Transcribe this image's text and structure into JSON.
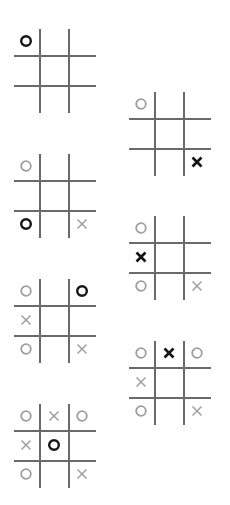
{
  "diagram": {
    "title": "",
    "colors": {
      "grid_line": "#6a6a6a",
      "mark_recent": "#151515",
      "mark_previous": "#9e9e9e",
      "background": "#ffffff"
    },
    "boards": [
      {
        "id": 1,
        "position": {
          "x": 14,
          "y": 29
        },
        "cells": [
          [
            {
              "mark": "O",
              "recent": true
            },
            {
              "mark": "",
              "recent": false
            },
            {
              "mark": "",
              "recent": false
            }
          ],
          [
            {
              "mark": "",
              "recent": false
            },
            {
              "mark": "",
              "recent": false
            },
            {
              "mark": "",
              "recent": false
            }
          ],
          [
            {
              "mark": "",
              "recent": false
            },
            {
              "mark": "",
              "recent": false
            },
            {
              "mark": "",
              "recent": false
            }
          ]
        ]
      },
      {
        "id": 2,
        "position": {
          "x": 129,
          "y": 92
        },
        "cells": [
          [
            {
              "mark": "O",
              "recent": false
            },
            {
              "mark": "",
              "recent": false
            },
            {
              "mark": "",
              "recent": false
            }
          ],
          [
            {
              "mark": "",
              "recent": false
            },
            {
              "mark": "",
              "recent": false
            },
            {
              "mark": "",
              "recent": false
            }
          ],
          [
            {
              "mark": "",
              "recent": false
            },
            {
              "mark": "",
              "recent": false
            },
            {
              "mark": "X",
              "recent": true
            }
          ]
        ]
      },
      {
        "id": 3,
        "position": {
          "x": 14,
          "y": 154
        },
        "cells": [
          [
            {
              "mark": "O",
              "recent": false
            },
            {
              "mark": "",
              "recent": false
            },
            {
              "mark": "",
              "recent": false
            }
          ],
          [
            {
              "mark": "",
              "recent": false
            },
            {
              "mark": "",
              "recent": false
            },
            {
              "mark": "",
              "recent": false
            }
          ],
          [
            {
              "mark": "O",
              "recent": true
            },
            {
              "mark": "",
              "recent": false
            },
            {
              "mark": "X",
              "recent": false
            }
          ]
        ]
      },
      {
        "id": 4,
        "position": {
          "x": 129,
          "y": 216
        },
        "cells": [
          [
            {
              "mark": "O",
              "recent": false
            },
            {
              "mark": "",
              "recent": false
            },
            {
              "mark": "",
              "recent": false
            }
          ],
          [
            {
              "mark": "X",
              "recent": true
            },
            {
              "mark": "",
              "recent": false
            },
            {
              "mark": "",
              "recent": false
            }
          ],
          [
            {
              "mark": "O",
              "recent": false
            },
            {
              "mark": "",
              "recent": false
            },
            {
              "mark": "X",
              "recent": false
            }
          ]
        ]
      },
      {
        "id": 5,
        "position": {
          "x": 14,
          "y": 279
        },
        "cells": [
          [
            {
              "mark": "O",
              "recent": false
            },
            {
              "mark": "",
              "recent": false
            },
            {
              "mark": "O",
              "recent": true
            }
          ],
          [
            {
              "mark": "X",
              "recent": false
            },
            {
              "mark": "",
              "recent": false
            },
            {
              "mark": "",
              "recent": false
            }
          ],
          [
            {
              "mark": "O",
              "recent": false
            },
            {
              "mark": "",
              "recent": false
            },
            {
              "mark": "X",
              "recent": false
            }
          ]
        ]
      },
      {
        "id": 6,
        "position": {
          "x": 129,
          "y": 341
        },
        "cells": [
          [
            {
              "mark": "O",
              "recent": false
            },
            {
              "mark": "X",
              "recent": true
            },
            {
              "mark": "O",
              "recent": false
            }
          ],
          [
            {
              "mark": "X",
              "recent": false
            },
            {
              "mark": "",
              "recent": false
            },
            {
              "mark": "",
              "recent": false
            }
          ],
          [
            {
              "mark": "O",
              "recent": false
            },
            {
              "mark": "",
              "recent": false
            },
            {
              "mark": "X",
              "recent": false
            }
          ]
        ]
      },
      {
        "id": 7,
        "position": {
          "x": 14,
          "y": 404
        },
        "cells": [
          [
            {
              "mark": "O",
              "recent": false
            },
            {
              "mark": "X",
              "recent": false
            },
            {
              "mark": "O",
              "recent": false
            }
          ],
          [
            {
              "mark": "X",
              "recent": false
            },
            {
              "mark": "O",
              "recent": true
            },
            {
              "mark": "",
              "recent": false
            }
          ],
          [
            {
              "mark": "O",
              "recent": false
            },
            {
              "mark": "",
              "recent": false
            },
            {
              "mark": "X",
              "recent": false
            }
          ]
        ]
      }
    ]
  }
}
